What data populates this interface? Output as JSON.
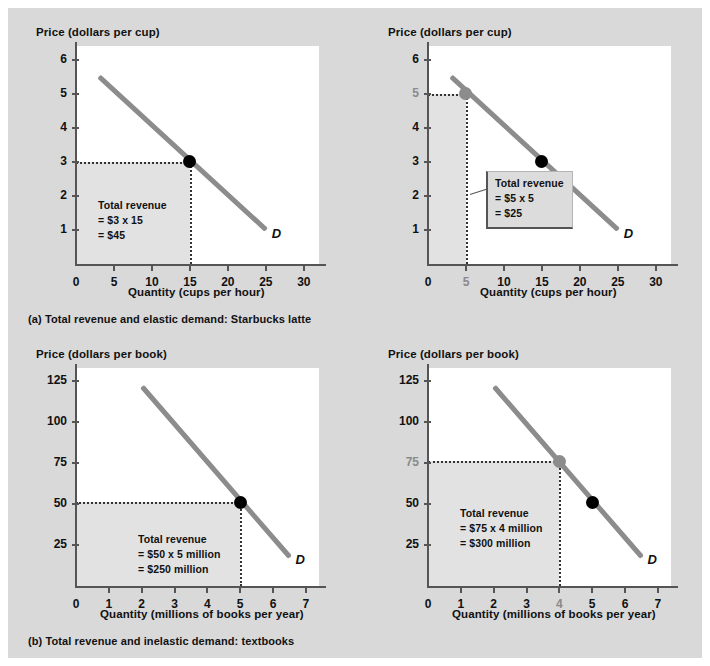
{
  "figure": {
    "background_color": "#d9d9d9",
    "curve_color": "#8c8c8c",
    "shade_color": "#e2e2e2",
    "marker_color": "#000000",
    "highlight_marker_color": "#8c8c8c"
  },
  "captions": {
    "a": "(a) Total revenue and elastic demand: Starbucks latte",
    "b": "(b) Total revenue and inelastic demand: textbooks"
  },
  "chart_data": [
    {
      "id": "panel-a-left",
      "type": "line",
      "title": "",
      "ylabel": "Price (dollars per cup)",
      "xlabel": "Quantity (cups per hour)",
      "xticks": [
        "0",
        "5",
        "10",
        "15",
        "20",
        "25",
        "30"
      ],
      "xtick_values": [
        0,
        5,
        10,
        15,
        20,
        25,
        30
      ],
      "yticks": [
        "1",
        "2",
        "3",
        "4",
        "5",
        "6"
      ],
      "ytick_values": [
        1,
        2,
        3,
        4,
        5,
        6
      ],
      "xlim": [
        0,
        32
      ],
      "ylim": [
        0,
        6.4
      ],
      "grid": false,
      "legend": "D",
      "series": [
        {
          "name": "D",
          "x": [
            3,
            25
          ],
          "y": [
            5.5,
            1.0
          ]
        }
      ],
      "markers": [
        {
          "x": 15,
          "y": 3,
          "color": "#000000",
          "label": ""
        }
      ],
      "highlight_xtick": null,
      "highlight_ytick": null,
      "shaded_rect": {
        "x0": 0,
        "y0": 0,
        "x1": 15,
        "y1": 3
      },
      "annotation": {
        "boxed": false,
        "lines": [
          "Total revenue",
          "= $3 x 15",
          "= $45"
        ]
      }
    },
    {
      "id": "panel-a-right",
      "type": "line",
      "title": "",
      "ylabel": "Price (dollars per cup)",
      "xlabel": "Quantity (cups per hour)",
      "xticks": [
        "0",
        "5",
        "10",
        "15",
        "20",
        "25",
        "30"
      ],
      "xtick_values": [
        0,
        5,
        10,
        15,
        20,
        25,
        30
      ],
      "yticks": [
        "1",
        "2",
        "3",
        "4",
        "5",
        "6"
      ],
      "ytick_values": [
        1,
        2,
        3,
        4,
        5,
        6
      ],
      "xlim": [
        0,
        32
      ],
      "ylim": [
        0,
        6.4
      ],
      "grid": false,
      "legend": "D",
      "series": [
        {
          "name": "D",
          "x": [
            3,
            25
          ],
          "y": [
            5.5,
            1.0
          ]
        }
      ],
      "markers": [
        {
          "x": 5,
          "y": 5,
          "color": "#8c8c8c",
          "label": ""
        },
        {
          "x": 15,
          "y": 3,
          "color": "#000000",
          "label": ""
        }
      ],
      "highlight_xtick": "5",
      "highlight_ytick": "5",
      "shaded_rect": {
        "x0": 0,
        "y0": 0,
        "x1": 5,
        "y1": 5
      },
      "annotation": {
        "boxed": true,
        "lines": [
          "Total revenue",
          "= $5 x 5",
          "= $25"
        ]
      }
    },
    {
      "id": "panel-b-left",
      "type": "line",
      "title": "",
      "ylabel": "Price (dollars per book)",
      "xlabel": "Quantity (millions of books per year)",
      "xticks": [
        "0",
        "1",
        "2",
        "3",
        "4",
        "5",
        "6",
        "7"
      ],
      "xtick_values": [
        0,
        1,
        2,
        3,
        4,
        5,
        6,
        7
      ],
      "yticks": [
        "25",
        "50",
        "75",
        "100",
        "125"
      ],
      "ytick_values": [
        25,
        50,
        75,
        100,
        125
      ],
      "xlim": [
        0,
        7.4
      ],
      "ylim": [
        0,
        133
      ],
      "grid": false,
      "legend": "D",
      "series": [
        {
          "name": "D",
          "x": [
            2,
            6.5
          ],
          "y": [
            122,
            18
          ]
        }
      ],
      "markers": [
        {
          "x": 5,
          "y": 51,
          "color": "#000000",
          "label": ""
        }
      ],
      "highlight_xtick": null,
      "highlight_ytick": null,
      "shaded_rect": {
        "x0": 0,
        "y0": 0,
        "x1": 5,
        "y1": 51
      },
      "annotation": {
        "boxed": false,
        "lines": [
          "Total revenue",
          "= $50 x 5 million",
          "= $250 million"
        ]
      }
    },
    {
      "id": "panel-b-right",
      "type": "line",
      "title": "",
      "ylabel": "Price (dollars per book)",
      "xlabel": "Quantity (millions of books per year)",
      "xticks": [
        "0",
        "1",
        "2",
        "3",
        "4",
        "5",
        "6",
        "7"
      ],
      "xtick_values": [
        0,
        1,
        2,
        3,
        4,
        5,
        6,
        7
      ],
      "yticks": [
        "25",
        "50",
        "75",
        "100",
        "125"
      ],
      "ytick_values": [
        25,
        50,
        75,
        100,
        125
      ],
      "xlim": [
        0,
        7.4
      ],
      "ylim": [
        0,
        133
      ],
      "grid": false,
      "legend": "D",
      "series": [
        {
          "name": "D",
          "x": [
            2,
            6.5
          ],
          "y": [
            122,
            18
          ]
        }
      ],
      "markers": [
        {
          "x": 4,
          "y": 76,
          "color": "#8c8c8c",
          "label": ""
        },
        {
          "x": 5,
          "y": 51,
          "color": "#000000",
          "label": ""
        }
      ],
      "highlight_xtick": "4",
      "highlight_ytick": "75",
      "shaded_rect": {
        "x0": 0,
        "y0": 0,
        "x1": 4,
        "y1": 76
      },
      "annotation": {
        "boxed": false,
        "lines": [
          "Total revenue",
          "= $75 x 4 million",
          "= $300 million"
        ]
      }
    }
  ]
}
